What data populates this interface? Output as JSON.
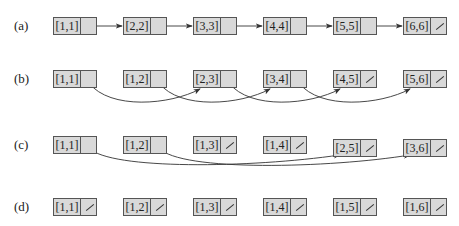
{
  "rows": [
    {
      "label": "(a)",
      "nodes": [
        "[1,1]",
        "[2,2]",
        "[3,3]",
        "[4,4]",
        "[5,5]",
        "[6,6]"
      ]
    },
    {
      "label": "(b)",
      "nodes": [
        "[1,1]",
        "[1,2]",
        "[2,3]",
        "[3,4]",
        "[4,5]",
        "[5,6]"
      ]
    },
    {
      "label": "(c)",
      "nodes": [
        "[1,1]",
        "[1,2]",
        "[1,3]",
        "[1,4]",
        "[2,5]",
        "[3,6]"
      ]
    },
    {
      "label": "(d)",
      "nodes": [
        "[1,1]",
        "[1,2]",
        "[1,3]",
        "[1,4]",
        "[1,5]",
        "[1,6]"
      ]
    }
  ],
  "null_pointers": {
    "a": [
      5
    ],
    "b": [
      4,
      5
    ],
    "c": [
      2,
      3,
      4,
      5
    ],
    "d": [
      0,
      1,
      2,
      3,
      4,
      5
    ]
  },
  "links": {
    "a": [
      [
        0,
        1
      ],
      [
        1,
        2
      ],
      [
        2,
        3
      ],
      [
        3,
        4
      ],
      [
        4,
        5
      ]
    ],
    "b": [
      [
        0,
        2
      ],
      [
        1,
        3
      ],
      [
        2,
        4
      ],
      [
        3,
        5
      ]
    ],
    "c": [
      [
        0,
        4
      ],
      [
        1,
        5
      ]
    ]
  },
  "colors": {
    "node_fill": "#d9d9d9",
    "stroke": "#555555",
    "arrow": "#333333"
  }
}
